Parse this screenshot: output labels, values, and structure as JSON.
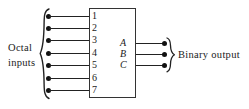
{
  "figure": {
    "type": "logic-block-diagram",
    "device": "octal-to-binary-encoder",
    "background_color": "#ffffff",
    "line_color": "#222222",
    "text_color": "#1a1a1a"
  },
  "left_label": {
    "line1": "Octal",
    "line2": "inputs"
  },
  "right_label": {
    "text": "Binary output"
  },
  "inputs": {
    "count": 7,
    "pins": [
      {
        "label": "1",
        "y": 16
      },
      {
        "label": "2",
        "y": 28
      },
      {
        "label": "3",
        "y": 40
      },
      {
        "label": "4",
        "y": 53
      },
      {
        "label": "5",
        "y": 65
      },
      {
        "label": "6",
        "y": 78
      },
      {
        "label": "7",
        "y": 90
      }
    ]
  },
  "outputs": {
    "count": 3,
    "pins": [
      {
        "label": "A",
        "y": 43
      },
      {
        "label": "B",
        "y": 54
      },
      {
        "label": "C",
        "y": 65
      }
    ]
  },
  "braces": {
    "left": "left-curly-brace",
    "right": "right-curly-brace"
  }
}
